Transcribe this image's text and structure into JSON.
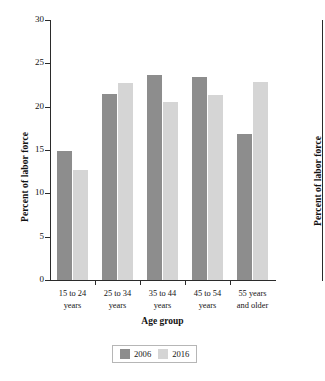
{
  "chart_data": {
    "type": "bar",
    "title": "",
    "xlabel": "Age group",
    "ylabel": "Percent of labor force",
    "ylim": [
      0,
      30
    ],
    "yticks": [
      0,
      5,
      10,
      15,
      20,
      25,
      30
    ],
    "grid": false,
    "legend_position": "bottom-center",
    "categories": [
      "15 to 24\nyears",
      "25 to 34\nyears",
      "35 to 44\nyears",
      "45 to 54\nyears",
      "55 years\nand older"
    ],
    "category_lines": [
      [
        "15 to 24",
        "years"
      ],
      [
        "25 to 34",
        "years"
      ],
      [
        "35 to 44",
        "years"
      ],
      [
        "45 to 54",
        "years"
      ],
      [
        "55 years",
        "and older"
      ]
    ],
    "series": [
      {
        "name": "2006",
        "color": "#8d8d8d",
        "values": [
          14.9,
          21.5,
          23.7,
          23.4,
          16.9
        ]
      },
      {
        "name": "2016",
        "color": "#d5d5d5",
        "values": [
          12.7,
          22.7,
          20.5,
          21.4,
          22.8
        ]
      }
    ]
  },
  "axes": {
    "y_tick_labels": [
      "30",
      "25",
      "20",
      "15",
      "10",
      "5",
      "0"
    ],
    "y_axis_title": "Percent of labor force",
    "x_axis_title": "Age group"
  },
  "legend": {
    "items": [
      {
        "label": "2006",
        "color": "#8d8d8d"
      },
      {
        "label": "2016",
        "color": "#d5d5d5"
      }
    ]
  },
  "adjacent_figure": {
    "y_axis_title": "Percent of labor force"
  },
  "colors": {
    "series_2006": "#8d8d8d",
    "series_2016": "#d5d5d5",
    "axis": "#2b2b2b",
    "text": "#131313",
    "background": "#ffffff"
  }
}
